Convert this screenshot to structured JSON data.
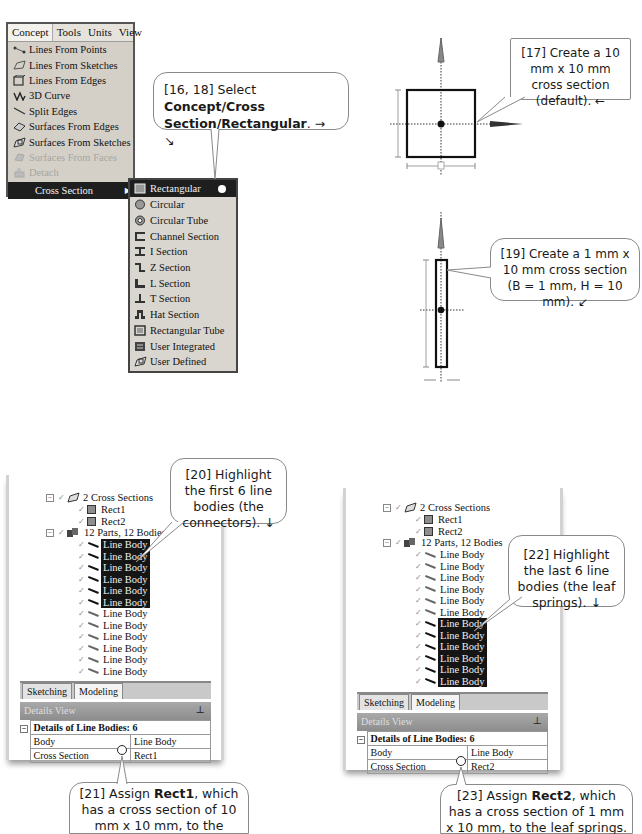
{
  "concept_menu": {
    "menubar": [
      "Concept",
      "Tools",
      "Units",
      "View"
    ],
    "active_menu": "Concept",
    "items": [
      {
        "label": "Lines From Points",
        "icon": "lines-from-points-icon",
        "disabled": false
      },
      {
        "label": "Lines From Sketches",
        "icon": "lines-from-sketches-icon",
        "disabled": false
      },
      {
        "label": "Lines From Edges",
        "icon": "lines-from-edges-icon",
        "disabled": false
      },
      {
        "label": "3D Curve",
        "icon": "3d-curve-icon",
        "disabled": false
      },
      {
        "label": "Split Edges",
        "icon": "split-edges-icon",
        "disabled": false
      },
      {
        "label": "Surfaces From Edges",
        "icon": "surfaces-from-edges-icon",
        "disabled": false
      },
      {
        "label": "Surfaces From Sketches",
        "icon": "surfaces-from-sketches-icon",
        "disabled": false
      },
      {
        "label": "Surfaces From Faces",
        "icon": "surfaces-from-faces-icon",
        "disabled": true
      },
      {
        "label": "Detach",
        "icon": "detach-icon",
        "disabled": true
      },
      {
        "label": "Cross Section",
        "icon": "",
        "disabled": false,
        "selected": true,
        "has_submenu": true
      }
    ]
  },
  "cross_section_submenu": {
    "items": [
      {
        "label": "Rectangular",
        "icon": "rectangular-icon",
        "selected": true
      },
      {
        "label": "Circular",
        "icon": "circular-icon"
      },
      {
        "label": "Circular Tube",
        "icon": "circular-tube-icon"
      },
      {
        "label": "Channel Section",
        "icon": "channel-section-icon"
      },
      {
        "label": "I Section",
        "icon": "i-section-icon"
      },
      {
        "label": "Z Section",
        "icon": "z-section-icon"
      },
      {
        "label": "L Section",
        "icon": "l-section-icon"
      },
      {
        "label": "T Section",
        "icon": "t-section-icon"
      },
      {
        "label": "Hat Section",
        "icon": "hat-section-icon"
      },
      {
        "label": "Rectangular Tube",
        "icon": "rectangular-tube-icon"
      },
      {
        "label": "User Integrated",
        "icon": "user-integrated-icon"
      },
      {
        "label": "User Defined",
        "icon": "user-defined-icon"
      }
    ]
  },
  "callouts": {
    "c16_pre": "[16, 18] Select ",
    "c16_bold": "Concept/Cross Section/Rectangular",
    "c16_post": ". → ↘",
    "c17": "[17] Create a 10 mm x 10 mm cross section (default). ←",
    "c19": "[19] Create a 1 mm x 10 mm cross section (B = 1 mm, H = 10 mm). ↙",
    "c20": "[20] Highlight the first 6 line bodies (the connectors). ↓",
    "c21_pre": "[21] Assign ",
    "c21_bold": "Rect1",
    "c21_post": ", which has a cross section of 10 mm x 10 mm, to the connectors. ↗",
    "c22": "[22] Highlight the last 6 line bodies (the leaf springs). ↓",
    "c23_pre": "[23] Assign ",
    "c23_bold": "Rect2",
    "c23_post": ", which has a cross section of 1 mm x 10 mm, to the leaf springs. ↵"
  },
  "tree_left": {
    "cross_sections_label": "2 Cross Sections",
    "sections": [
      "Rect1",
      "Rect2"
    ],
    "parts_label": "12 Parts, 12 Bodies",
    "bodies": [
      "Line Body",
      "Line Body",
      "Line Body",
      "Line Body",
      "Line Body",
      "Line Body",
      "Line Body",
      "Line Body",
      "Line Body",
      "Line Body",
      "Line Body",
      "Line Body"
    ],
    "highlighted_range": [
      0,
      5
    ],
    "tabs": [
      "Sketching",
      "Modeling"
    ],
    "active_tab": "Modeling",
    "details_title": "Details View",
    "details_header": "Details of Line Bodies: 6",
    "details_rows": [
      {
        "key": "Body",
        "value": "Line Body"
      },
      {
        "key": "Cross Section",
        "value": "Rect1"
      }
    ]
  },
  "tree_right": {
    "cross_sections_label": "2 Cross Sections",
    "sections": [
      "Rect1",
      "Rect2"
    ],
    "parts_label": "12 Parts, 12 Bodies",
    "bodies": [
      "Line Body",
      "Line Body",
      "Line Body",
      "Line Body",
      "Line Body",
      "Line Body",
      "Line Body",
      "Line Body",
      "Line Body",
      "Line Body",
      "Line Body",
      "Line Body"
    ],
    "highlighted_range": [
      6,
      11
    ],
    "tabs": [
      "Sketching",
      "Modeling"
    ],
    "active_tab": "Modeling",
    "details_title": "Details View",
    "details_header": "Details of Line Bodies: 6",
    "details_rows": [
      {
        "key": "Body",
        "value": "Line Body"
      },
      {
        "key": "Cross Section",
        "value": "Rect2"
      }
    ]
  }
}
